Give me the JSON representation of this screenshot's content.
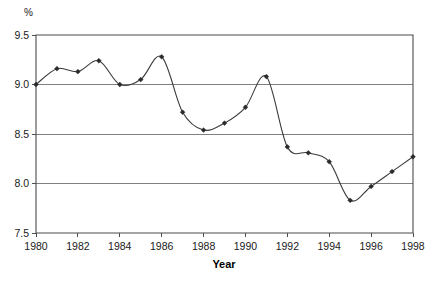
{
  "chart_data": {
    "type": "line",
    "title": "",
    "xlabel": "Year",
    "ylabel": "%",
    "unit_label": "%",
    "x": [
      1980,
      1981,
      1982,
      1983,
      1984,
      1985,
      1986,
      1987,
      1988,
      1989,
      1990,
      1991,
      1992,
      1993,
      1994,
      1995,
      1996,
      1997,
      1998
    ],
    "values": [
      9.0,
      9.16,
      9.13,
      9.24,
      9.0,
      9.05,
      9.28,
      8.72,
      8.54,
      8.61,
      8.77,
      9.08,
      8.37,
      8.31,
      8.22,
      7.83,
      7.97,
      8.12,
      8.27
    ],
    "series": [
      {
        "name": "rate",
        "values": [
          9.0,
          9.16,
          9.13,
          9.24,
          9.0,
          9.05,
          9.28,
          8.72,
          8.54,
          8.61,
          8.77,
          9.08,
          8.37,
          8.31,
          8.22,
          7.83,
          7.97,
          8.12,
          8.27
        ]
      }
    ],
    "xlim": [
      1980,
      1998
    ],
    "ylim": [
      7.5,
      9.5
    ],
    "yticks": [
      7.5,
      8.0,
      8.5,
      9.0,
      9.5
    ],
    "ytick_labels": [
      "7.5",
      "8.0",
      "8.5",
      "9.0",
      "9.5"
    ],
    "xticks": [
      1980,
      1982,
      1984,
      1986,
      1988,
      1990,
      1992,
      1994,
      1996,
      1998
    ],
    "xtick_labels": [
      "1980",
      "1982",
      "1984",
      "1986",
      "1988",
      "1990",
      "1992",
      "1994",
      "1996",
      "1998"
    ],
    "grid": true,
    "grid_axis": "y",
    "legend": false,
    "markers": "diamond",
    "smoothing": "spline",
    "colors": {
      "line": "#3b3b3b",
      "marker": "#2b2b2b",
      "grid": "#808080",
      "frame": "#4d4d4d",
      "background": "#ffffff",
      "text": "#1a1a1a"
    }
  }
}
